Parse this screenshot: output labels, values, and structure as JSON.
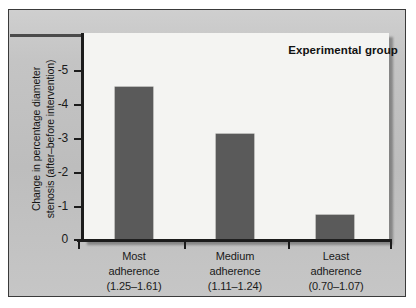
{
  "chart_data": {
    "type": "bar",
    "title": "Experimental group",
    "xlabel": "",
    "ylabel": "Change in percentage diameter stenosis (after–before intervention)",
    "categories": [
      "Most adherence (1.25–1.61)",
      "Medium adherence (1.11–1.24)",
      "Least adherence (0.70–1.07)"
    ],
    "values": [
      -4.5,
      -3.1,
      -0.7
    ],
    "ylim": [
      0,
      -5
    ],
    "ytick_labels": [
      "0",
      "-1",
      "-2",
      "-3",
      "-4",
      "-5"
    ],
    "ytick_values": [
      0,
      -1,
      -2,
      -3,
      -4,
      -5
    ],
    "grid": false,
    "legend": "none",
    "bar_color": "#5a5a5a",
    "plot_background": "#f4f4f2",
    "panel_background": "#c2c2c2"
  },
  "chart": {
    "title": "Experimental group",
    "y_axis_title_line1": "Change in percentage diameter",
    "y_axis_title_line2": "stenosis (after–before intervention)",
    "y_ticks": [
      {
        "label": "-5"
      },
      {
        "label": "-4"
      },
      {
        "label": "-3"
      },
      {
        "label": "-2"
      },
      {
        "label": "-1"
      },
      {
        "label": "0"
      }
    ],
    "categories": [
      {
        "name": "Most",
        "line2": "adherence",
        "range": "(1.25–1.61)",
        "value": -4.5
      },
      {
        "name": "Medium",
        "line2": "adherence",
        "range": "(1.11–1.24)",
        "value": -3.1
      },
      {
        "name": "Least",
        "line2": "adherence",
        "range": "(0.70–1.07)",
        "value": -0.7
      }
    ]
  }
}
